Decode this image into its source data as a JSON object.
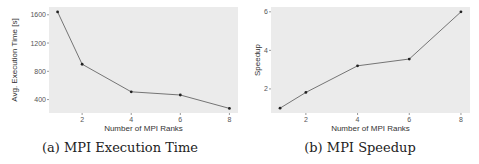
{
  "chart_data": [
    {
      "type": "line",
      "title": "",
      "caption": "(a) MPI Execution Time",
      "xlabel": "Number of MPI Ranks",
      "ylabel": "Avg. Execution Time [s]",
      "x": [
        1,
        2,
        4,
        6,
        8
      ],
      "series": [
        {
          "name": "Execution Time",
          "values": [
            1640,
            900,
            510,
            465,
            275
          ]
        }
      ],
      "xticks": [
        2,
        4,
        6,
        8
      ],
      "yticks": [
        400,
        800,
        1200,
        1600
      ],
      "xlim": [
        0.65,
        8.35
      ],
      "ylim": [
        210,
        1710
      ],
      "grid": false,
      "legend": null,
      "colors": {
        "panel": "#ebebeb",
        "line": "#555555",
        "point": "#222222"
      }
    },
    {
      "type": "line",
      "title": "",
      "caption": "(b) MPI Speedup",
      "xlabel": "Number of MPI Ranks",
      "ylabel": "Speedup",
      "x": [
        1,
        2,
        4,
        6,
        8
      ],
      "series": [
        {
          "name": "Speedup",
          "values": [
            1.0,
            1.82,
            3.2,
            3.55,
            6.0
          ]
        }
      ],
      "xticks": [
        2,
        4,
        6,
        8
      ],
      "yticks": [
        2,
        4,
        6
      ],
      "xlim": [
        0.65,
        8.35
      ],
      "ylim": [
        0.75,
        6.25
      ],
      "grid": false,
      "legend": null,
      "colors": {
        "panel": "#ebebeb",
        "line": "#555555",
        "point": "#222222"
      }
    }
  ],
  "captions": {
    "a": "(a) MPI Execution Time",
    "b": "(b) MPI Speedup"
  },
  "axes": {
    "a": {
      "xlabel": "Number of MPI Ranks",
      "ylabel": "Avg. Execution Time [s]"
    },
    "b": {
      "xlabel": "Number of MPI Ranks",
      "ylabel": "Speedup"
    }
  }
}
